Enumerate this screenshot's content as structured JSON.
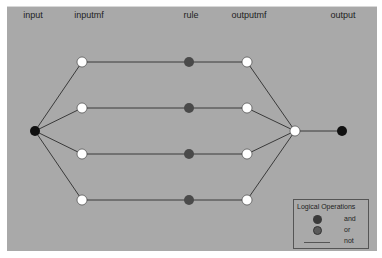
{
  "columns": [
    {
      "label": "input",
      "x": 33
    },
    {
      "label": "inputmf",
      "x": 89
    },
    {
      "label": "rule",
      "x": 191
    },
    {
      "label": "outputmf",
      "x": 249
    },
    {
      "label": "output",
      "x": 343
    }
  ],
  "colors": {
    "background": "#a9a9a9",
    "input_node": "#111111",
    "membership_node": "#ffffff",
    "rule_node": "#4a4a4a",
    "output_node": "#111111",
    "edge": "#3a3a3a",
    "and_symbol": "#3a3a3a",
    "or_symbol": "#5a5a5a"
  },
  "nodes": {
    "input": {
      "x": 35,
      "y": 131
    },
    "inputmf": [
      {
        "x": 82,
        "y": 62
      },
      {
        "x": 82,
        "y": 108
      },
      {
        "x": 82,
        "y": 154
      },
      {
        "x": 82,
        "y": 200
      }
    ],
    "rule": [
      {
        "x": 189,
        "y": 62
      },
      {
        "x": 189,
        "y": 108
      },
      {
        "x": 189,
        "y": 154
      },
      {
        "x": 189,
        "y": 200
      }
    ],
    "outputmf": [
      {
        "x": 247,
        "y": 62
      },
      {
        "x": 247,
        "y": 108
      },
      {
        "x": 247,
        "y": 154
      },
      {
        "x": 247,
        "y": 200
      }
    ],
    "aggregate": {
      "x": 295,
      "y": 131
    },
    "output": {
      "x": 342,
      "y": 131
    }
  },
  "legend": {
    "title": "Logical Operations",
    "items": [
      {
        "label": "and",
        "symbol": "filled-circle-dark"
      },
      {
        "label": "or",
        "symbol": "filled-circle-gray"
      },
      {
        "label": "not",
        "symbol": "line"
      }
    ]
  }
}
